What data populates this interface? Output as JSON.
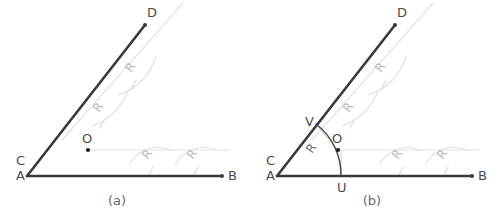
{
  "figure": {
    "background_color": "#ffffff",
    "line_color": "#3a3a3c",
    "ghost_color": "#e3e3e6",
    "label_color": "#4b4b4d",
    "r_label_color": "#b9b9bf",
    "arc_color": "#4a4a4c"
  },
  "panels": [
    {
      "id": "panel-a",
      "caption": "(a)",
      "caption_x": 117,
      "caption_y": 205,
      "vertex": {
        "x": 27,
        "y": 176
      },
      "labels": {
        "vertex_upper": "C",
        "vertex_lower": "A",
        "ray_up_end": "D",
        "ray_right_end": "B",
        "center": "O"
      },
      "points": {
        "C": {
          "x": 16,
          "y": 165,
          "label": "C"
        },
        "A": {
          "x": 16,
          "y": 180,
          "label": "A"
        },
        "D": {
          "x": 147,
          "y": 17,
          "label": "D"
        },
        "B": {
          "x": 228,
          "y": 180,
          "label": "B"
        },
        "O": {
          "x": 87,
          "y": 139,
          "label": "O"
        },
        "O_dot": {
          "x": 88,
          "y": 150
        }
      },
      "rays": {
        "up_end": {
          "x": 145,
          "y": 25
        },
        "right_end": {
          "x": 222,
          "y": 176
        }
      },
      "r_labels": [
        {
          "text": "R",
          "x": 131,
          "y": 73,
          "rotate": -55
        },
        {
          "text": "R",
          "x": 99,
          "y": 113,
          "rotate": -55
        },
        {
          "text": "R",
          "x": 148,
          "y": 160,
          "rotate": -55
        },
        {
          "text": "R",
          "x": 193,
          "y": 160,
          "rotate": -55
        }
      ]
    },
    {
      "id": "panel-b",
      "caption": "(b)",
      "caption_x": 372,
      "caption_y": 205,
      "vertex": {
        "x": 277,
        "y": 176
      },
      "labels": {
        "vertex_upper": "C",
        "vertex_lower": "A",
        "ray_up_end": "D",
        "ray_right_end": "B",
        "center": "O",
        "arc_on_ray_up": "V",
        "arc_on_ray_right": "U"
      },
      "points": {
        "C": {
          "x": 266,
          "y": 165,
          "label": "C"
        },
        "A": {
          "x": 266,
          "y": 180,
          "label": "A"
        },
        "D": {
          "x": 397,
          "y": 17,
          "label": "D"
        },
        "B": {
          "x": 478,
          "y": 180,
          "label": "B"
        },
        "O": {
          "x": 337,
          "y": 139,
          "label": "O"
        },
        "O_dot": {
          "x": 338,
          "y": 150
        },
        "V": {
          "x": 312,
          "y": 122,
          "label": "V"
        },
        "U": {
          "x": 341,
          "y": 190,
          "label": "U"
        }
      },
      "rays": {
        "up_end": {
          "x": 395,
          "y": 25
        },
        "right_end": {
          "x": 472,
          "y": 176
        }
      },
      "bisector_arc": {
        "center_x": 277,
        "center_y": 176,
        "radius": 64,
        "from_x": 318,
        "from_y": 127,
        "to_x": 341,
        "to_y": 176
      },
      "r_labels": [
        {
          "text": "R",
          "x": 381,
          "y": 73,
          "rotate": -55
        },
        {
          "text": "R",
          "x": 349,
          "y": 113,
          "rotate": -55
        },
        {
          "text": "R",
          "x": 398,
          "y": 160,
          "rotate": -55
        },
        {
          "text": "R",
          "x": 443,
          "y": 160,
          "rotate": -55
        },
        {
          "text": "R",
          "x": 316,
          "y": 152,
          "rotate": -55
        }
      ]
    }
  ]
}
